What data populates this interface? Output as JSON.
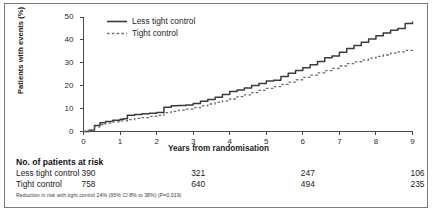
{
  "chart_data": {
    "type": "line",
    "title": "",
    "xlabel": "Years from randomisation",
    "ylabel": "Patients with events (%)",
    "xlim": [
      0,
      9
    ],
    "ylim": [
      0,
      50
    ],
    "xticks": [
      "0",
      "1",
      "2",
      "3",
      "4",
      "5",
      "6",
      "7",
      "8",
      "9"
    ],
    "yticks": [
      "0",
      "10",
      "20",
      "30",
      "40",
      "50"
    ],
    "grid": false,
    "legend_position": "top-left",
    "series": [
      {
        "name": "Less tight control",
        "style": "solid",
        "color": "#3b3b3b",
        "x": [
          0,
          0.15,
          0.3,
          0.45,
          0.6,
          0.8,
          1.0,
          1.1,
          1.2,
          1.4,
          1.6,
          1.8,
          2.0,
          2.2,
          2.4,
          2.6,
          2.8,
          3.0,
          3.2,
          3.4,
          3.6,
          3.8,
          4.0,
          4.2,
          4.4,
          4.6,
          4.8,
          5.0,
          5.2,
          5.4,
          5.6,
          5.8,
          6.0,
          6.2,
          6.4,
          6.6,
          6.8,
          7.0,
          7.2,
          7.4,
          7.6,
          7.8,
          8.0,
          8.2,
          8.4,
          8.6,
          8.8,
          9.0
        ],
        "y": [
          0,
          0.6,
          2.6,
          3.8,
          4.4,
          4.9,
          5.3,
          5.6,
          7.1,
          7.4,
          7.7,
          8.0,
          8.3,
          10.6,
          11.2,
          11.4,
          11.6,
          12.2,
          13.2,
          14.0,
          15.0,
          16.2,
          17.5,
          18.1,
          19.0,
          20.1,
          21.0,
          22.0,
          22.4,
          24.0,
          25.4,
          26.6,
          27.8,
          29.2,
          30.6,
          32.2,
          33.0,
          34.6,
          36.2,
          37.6,
          39.0,
          40.4,
          41.8,
          43.0,
          44.2,
          45.0,
          47.2,
          48.0
        ]
      },
      {
        "name": "Tight control",
        "style": "dotted",
        "color": "#6e6e6e",
        "x": [
          0,
          0.15,
          0.3,
          0.45,
          0.6,
          0.8,
          1.0,
          1.2,
          1.4,
          1.6,
          1.8,
          2.0,
          2.2,
          2.4,
          2.6,
          2.8,
          3.0,
          3.2,
          3.4,
          3.6,
          3.8,
          4.0,
          4.2,
          4.4,
          4.6,
          4.8,
          5.0,
          5.2,
          5.4,
          5.6,
          5.8,
          6.0,
          6.2,
          6.4,
          6.6,
          6.8,
          7.0,
          7.2,
          7.4,
          7.6,
          7.8,
          8.0,
          8.2,
          8.4,
          8.6,
          8.8,
          9.0
        ],
        "y": [
          0,
          0.5,
          2.0,
          3.0,
          3.7,
          4.2,
          4.6,
          5.2,
          5.7,
          6.1,
          6.6,
          7.0,
          8.2,
          8.8,
          9.3,
          9.8,
          10.4,
          11.2,
          12.0,
          12.8,
          13.4,
          14.2,
          15.2,
          16.0,
          17.0,
          18.0,
          18.8,
          19.6,
          20.6,
          21.6,
          22.6,
          23.6,
          24.6,
          25.6,
          26.6,
          27.6,
          28.6,
          29.6,
          30.4,
          31.2,
          32.0,
          32.8,
          33.4,
          34.2,
          34.8,
          35.4,
          36.0
        ]
      }
    ]
  },
  "legend": {
    "entries": [
      {
        "label": "Less tight control",
        "style": "solid"
      },
      {
        "label": "Tight control",
        "style": "dotted"
      }
    ]
  },
  "risk_table": {
    "title": "No. of patients at risk",
    "columns_years": [
      "0",
      "3",
      "6",
      "9"
    ],
    "rows": [
      {
        "label": "Less tight control",
        "values": [
          "390",
          "321",
          "247",
          "106"
        ]
      },
      {
        "label": "Tight control",
        "values": [
          "758",
          "640",
          "494",
          "235"
        ]
      }
    ]
  },
  "footnote": {
    "text": "Reduction in risk with tight control 24% (95% CI 8% to 38%) (P=0.019)"
  },
  "colors": {
    "solid_series": "#3b3b3b",
    "dotted_series": "#6e6e6e",
    "axis": "#4a4a4a",
    "frame": "#7a7a7a",
    "text": "#1d1d1d"
  }
}
